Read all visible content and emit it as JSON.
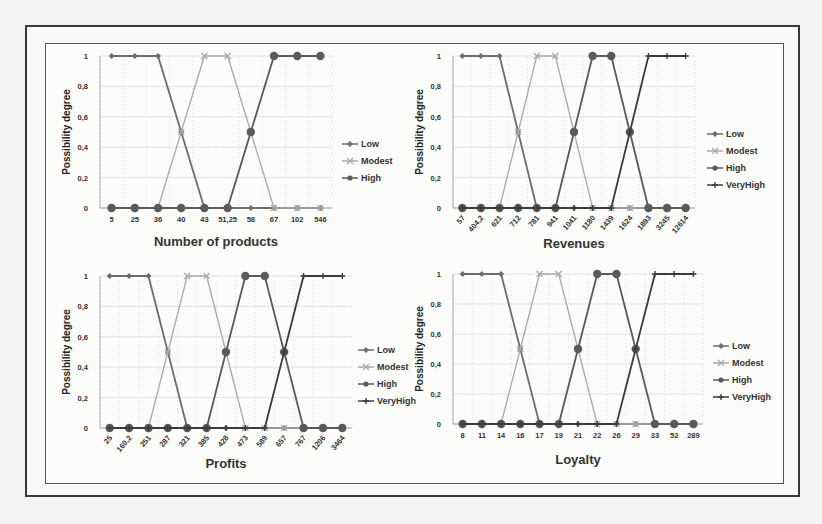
{
  "figure": {
    "colors": {
      "Low": "#6d6d6d",
      "Modest": "#a9a9a9",
      "High": "#5a5a5a",
      "VeryHigh": "#3c3c3c",
      "grid": "#dcdcdc",
      "axis": "#999999"
    }
  },
  "chart_data": [
    {
      "type": "line",
      "title": "",
      "xlabel": "Number of products",
      "ylabel": "Possibility degree",
      "ylim": [
        0,
        1
      ],
      "yticks": [
        "0",
        "0,2",
        "0,4",
        "0,6",
        "0,8",
        "1"
      ],
      "grid": true,
      "legend": "right",
      "rotate_x_labels": false,
      "categories": [
        "5",
        "25",
        "36",
        "40",
        "43",
        "51,25",
        "58",
        "67",
        "102",
        "546"
      ],
      "series": [
        {
          "name": "Low",
          "marker": "diamond",
          "values": [
            1,
            1,
            1,
            0.5,
            0,
            0,
            0,
            0,
            0,
            0
          ]
        },
        {
          "name": "Modest",
          "marker": "x",
          "values": [
            0,
            0,
            0,
            0.5,
            1,
            1,
            0.5,
            0,
            0,
            0
          ]
        },
        {
          "name": "High",
          "marker": "circle",
          "values": [
            0,
            0,
            0,
            0,
            0,
            0,
            0.5,
            1,
            1,
            1
          ]
        }
      ]
    },
    {
      "type": "line",
      "title": "",
      "xlabel": "Revenues",
      "ylabel": "Possibility degree",
      "ylim": [
        0,
        1
      ],
      "yticks": [
        "0",
        "0,2",
        "0,4",
        "0,6",
        "0,8",
        "1"
      ],
      "grid": true,
      "legend": "right",
      "rotate_x_labels": true,
      "categories": [
        "57",
        "404,2",
        "621",
        "712",
        "781",
        "941",
        "1041",
        "1180",
        "1439",
        "1624",
        "1893",
        "3245",
        "12614"
      ],
      "series": [
        {
          "name": "Low",
          "marker": "diamond",
          "values": [
            1,
            1,
            1,
            0.5,
            0,
            0,
            0,
            0,
            0,
            0,
            0,
            0,
            0
          ]
        },
        {
          "name": "Modest",
          "marker": "x",
          "values": [
            0,
            0,
            0,
            0.5,
            1,
            1,
            0.5,
            0,
            0,
            0,
            0,
            0,
            0
          ]
        },
        {
          "name": "High",
          "marker": "circle",
          "values": [
            0,
            0,
            0,
            0,
            0,
            0,
            0.5,
            1,
            1,
            0.5,
            0,
            0,
            0
          ]
        },
        {
          "name": "VeryHigh",
          "marker": "plus",
          "values": [
            0,
            0,
            0,
            0,
            0,
            0,
            0,
            0,
            0,
            0.5,
            1,
            1,
            1
          ]
        }
      ]
    },
    {
      "type": "line",
      "title": "",
      "xlabel": "Profits",
      "ylabel": "Possibility degree",
      "ylim": [
        0,
        1
      ],
      "yticks": [
        "0",
        "0,2",
        "0,4",
        "0,6",
        "0,8",
        "1"
      ],
      "grid": true,
      "legend": "right",
      "rotate_x_labels": true,
      "categories": [
        "25",
        "160,2",
        "251",
        "287",
        "321",
        "385",
        "428",
        "473",
        "589",
        "657",
        "767",
        "1206",
        "3464"
      ],
      "series": [
        {
          "name": "Low",
          "marker": "diamond",
          "values": [
            1,
            1,
            1,
            0.5,
            0,
            0,
            0,
            0,
            0,
            0,
            0,
            0,
            0
          ]
        },
        {
          "name": "Modest",
          "marker": "x",
          "values": [
            0,
            0,
            0,
            0.5,
            1,
            1,
            0.5,
            0,
            0,
            0,
            0,
            0,
            0
          ]
        },
        {
          "name": "High",
          "marker": "circle",
          "values": [
            0,
            0,
            0,
            0,
            0,
            0,
            0.5,
            1,
            1,
            0.5,
            0,
            0,
            0
          ]
        },
        {
          "name": "VeryHigh",
          "marker": "plus",
          "values": [
            0,
            0,
            0,
            0,
            0,
            0,
            0,
            0,
            0,
            0.5,
            1,
            1,
            1
          ]
        }
      ]
    },
    {
      "type": "line",
      "title": "",
      "xlabel": "Loyalty",
      "ylabel": "Possibility degree",
      "ylim": [
        0,
        1
      ],
      "yticks": [
        "0",
        "0,2",
        "0,4",
        "0,6",
        "0,8",
        "1"
      ],
      "grid": true,
      "legend": "right",
      "rotate_x_labels": false,
      "categories": [
        "8",
        "11",
        "14",
        "16",
        "17",
        "19",
        "21",
        "22",
        "26",
        "29",
        "33",
        "52",
        "289"
      ],
      "series": [
        {
          "name": "Low",
          "marker": "diamond",
          "values": [
            1,
            1,
            1,
            0.5,
            0,
            0,
            0,
            0,
            0,
            0,
            0,
            0,
            0
          ]
        },
        {
          "name": "Modest",
          "marker": "x",
          "values": [
            0,
            0,
            0,
            0.5,
            1,
            1,
            0.5,
            0,
            0,
            0,
            0,
            0,
            0
          ]
        },
        {
          "name": "High",
          "marker": "circle",
          "values": [
            0,
            0,
            0,
            0,
            0,
            0,
            0.5,
            1,
            1,
            0.5,
            0,
            0,
            0
          ]
        },
        {
          "name": "VeryHigh",
          "marker": "plus",
          "values": [
            0,
            0,
            0,
            0,
            0,
            0,
            0,
            0,
            0,
            0.5,
            1,
            1,
            1
          ]
        }
      ]
    }
  ]
}
